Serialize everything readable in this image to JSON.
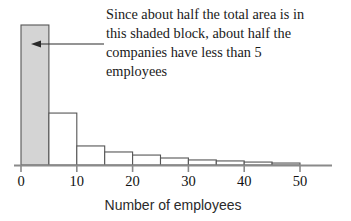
{
  "chart_data": {
    "type": "bar",
    "title": "",
    "subtitle": "",
    "xlabel": "Number of employees",
    "ylabel": "",
    "grid": false,
    "legend": "none",
    "xlim": [
      0,
      55
    ],
    "ylim": [
      0,
      1
    ],
    "bin_width": 5,
    "bin_edges": [
      0,
      5,
      10,
      15,
      20,
      25,
      30,
      35,
      40,
      45,
      50
    ],
    "categories": [
      "0-5",
      "5-10",
      "10-15",
      "15-20",
      "20-25",
      "25-30",
      "30-35",
      "35-40",
      "40-45",
      "45-50"
    ],
    "values": [
      1.0,
      0.371,
      0.136,
      0.093,
      0.071,
      0.05,
      0.036,
      0.029,
      0.021,
      0.014
    ],
    "tick_labels": [
      "0",
      "10",
      "20",
      "30",
      "40",
      "50"
    ],
    "tick_values": [
      0,
      10,
      20,
      30,
      40,
      50
    ],
    "highlighted_bin": "0-5",
    "annotations": [
      {
        "name": "shaded-block-note",
        "lines": [
          "Since about half the total area is in",
          "this shaded block, about half the",
          "companies have less than 5",
          "employees"
        ],
        "arrow": "points-left-into-shaded-bar"
      }
    ],
    "colors": {
      "highlight_fill": "#d4d4d4",
      "bar_fill": "#ffffff",
      "bar_stroke": "#555555",
      "axis": "#8a8a8a",
      "text": "#1a1a1a"
    }
  },
  "axis": {
    "x_title": "Number of employees"
  }
}
